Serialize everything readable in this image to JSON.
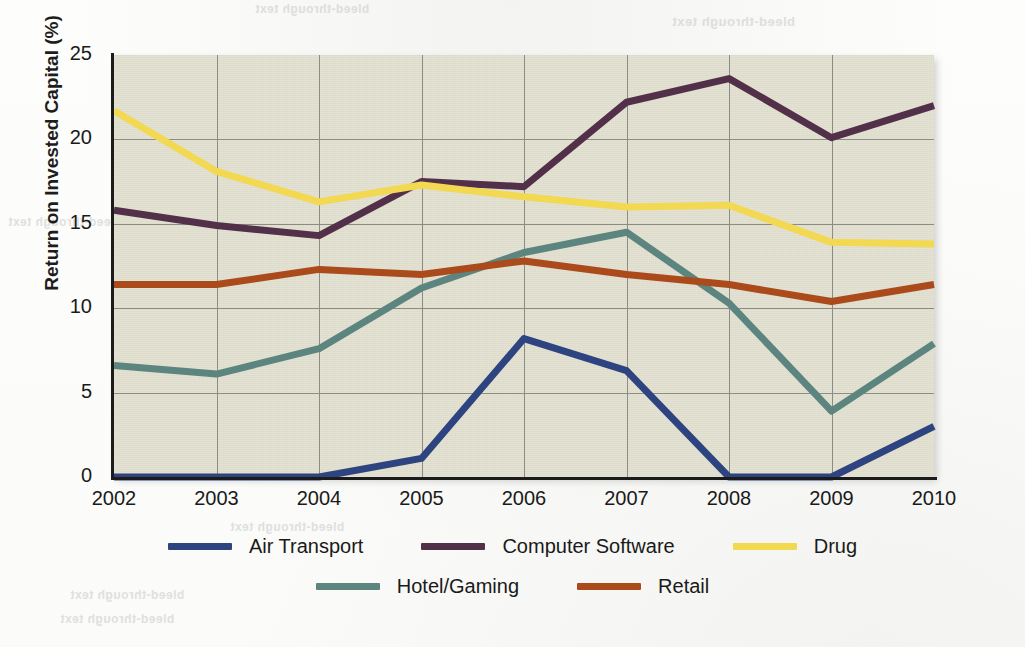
{
  "chart_data": {
    "type": "line",
    "title": "",
    "xlabel": "",
    "ylabel": "Return on Invested Capital (%)",
    "categories": [
      "2002",
      "2003",
      "2004",
      "2005",
      "2006",
      "2007",
      "2008",
      "2009",
      "2010"
    ],
    "x": [
      2002,
      2003,
      2004,
      2005,
      2006,
      2007,
      2008,
      2009,
      2010
    ],
    "xlim": [
      2002,
      2010
    ],
    "ylim": [
      0,
      25
    ],
    "yticks": [
      0,
      5,
      10,
      15,
      20,
      25
    ],
    "grid": true,
    "legend_position": "bottom",
    "series": [
      {
        "name": "Air Transport",
        "color": "#2d4480",
        "values": [
          0.0,
          0.0,
          0.0,
          1.1,
          8.2,
          6.3,
          0.0,
          0.0,
          3.0
        ]
      },
      {
        "name": "Computer Software",
        "color": "#533049",
        "values": [
          15.8,
          14.9,
          14.3,
          17.5,
          17.2,
          22.2,
          23.6,
          20.1,
          22.0
        ]
      },
      {
        "name": "Drug",
        "color": "#f3d852",
        "values": [
          21.7,
          18.1,
          16.3,
          17.3,
          16.6,
          16.0,
          16.1,
          13.9,
          13.8
        ]
      },
      {
        "name": "Hotel/Gaming",
        "color": "#5c857f",
        "values": [
          6.6,
          6.1,
          7.6,
          11.2,
          13.3,
          14.5,
          10.3,
          3.9,
          7.9
        ]
      },
      {
        "name": "Retail",
        "color": "#ab4a1b",
        "values": [
          11.4,
          11.4,
          12.3,
          12.0,
          12.8,
          12.0,
          11.4,
          10.4,
          11.4
        ]
      }
    ]
  },
  "axis": {
    "y_label": "Return on Invested Capital (%)",
    "y_ticks": [
      "25",
      "20",
      "15",
      "10",
      "5",
      "0"
    ],
    "x_ticks": [
      "2002",
      "2003",
      "2004",
      "2005",
      "2006",
      "2007",
      "2008",
      "2009",
      "2010"
    ]
  },
  "legend": {
    "row1": [
      {
        "label": "Air Transport",
        "color": "#2d4480"
      },
      {
        "label": "Computer Software",
        "color": "#533049"
      },
      {
        "label": "Drug",
        "color": "#f3d852"
      }
    ],
    "row2": [
      {
        "label": "Hotel/Gaming",
        "color": "#5c857f"
      },
      {
        "label": "Retail",
        "color": "#ab4a1b"
      }
    ]
  },
  "scan_artifacts": {
    "top": "bleed-through text",
    "right": "bleed-through text",
    "middle": "bleed-through text",
    "lower1": "bleed-through text",
    "lower2": "bleed-through text",
    "left": "bleed-through text"
  },
  "colors": {
    "plot_background": "#e2e0cf",
    "page_background": "#fdfdfb",
    "gridline": "#8c8c85",
    "axis": "#1b1b1b",
    "text": "#1a1a1a"
  }
}
